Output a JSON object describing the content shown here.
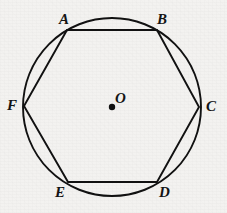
{
  "figure": {
    "type": "geometry-diagram",
    "background_color": "#f3f2f0",
    "stroke_color": "#111111",
    "canvas": {
      "width": 227,
      "height": 213
    }
  },
  "circle": {
    "center_label": "O",
    "center_x": 112,
    "center_y": 107,
    "radius": 89,
    "stroke_width": 1.9
  },
  "center_point": {
    "label": "O",
    "label_x": 115,
    "label_y": 91,
    "dot_x": 112,
    "dot_y": 107,
    "dot_radius": 3.2
  },
  "polygon": {
    "name": "hexagon",
    "sides": 6,
    "stroke_width": 1.9,
    "fill": "none",
    "vertex_order": [
      "A",
      "B",
      "C",
      "D",
      "E",
      "F"
    ],
    "points_attr": "67,30 157,30 199,107 157,182 68,182 24,106",
    "vertices": [
      {
        "label": "A",
        "x": 67,
        "y": 30,
        "label_x": 59,
        "label_y": 12
      },
      {
        "label": "B",
        "x": 157,
        "y": 30,
        "label_x": 157,
        "label_y": 12
      },
      {
        "label": "C",
        "x": 199,
        "y": 107,
        "label_x": 206,
        "label_y": 99
      },
      {
        "label": "D",
        "x": 157,
        "y": 182,
        "label_x": 159,
        "label_y": 185
      },
      {
        "label": "E",
        "x": 68,
        "y": 182,
        "label_x": 55,
        "label_y": 185
      },
      {
        "label": "F",
        "x": 24,
        "y": 106,
        "label_x": 7,
        "label_y": 98
      }
    ]
  }
}
